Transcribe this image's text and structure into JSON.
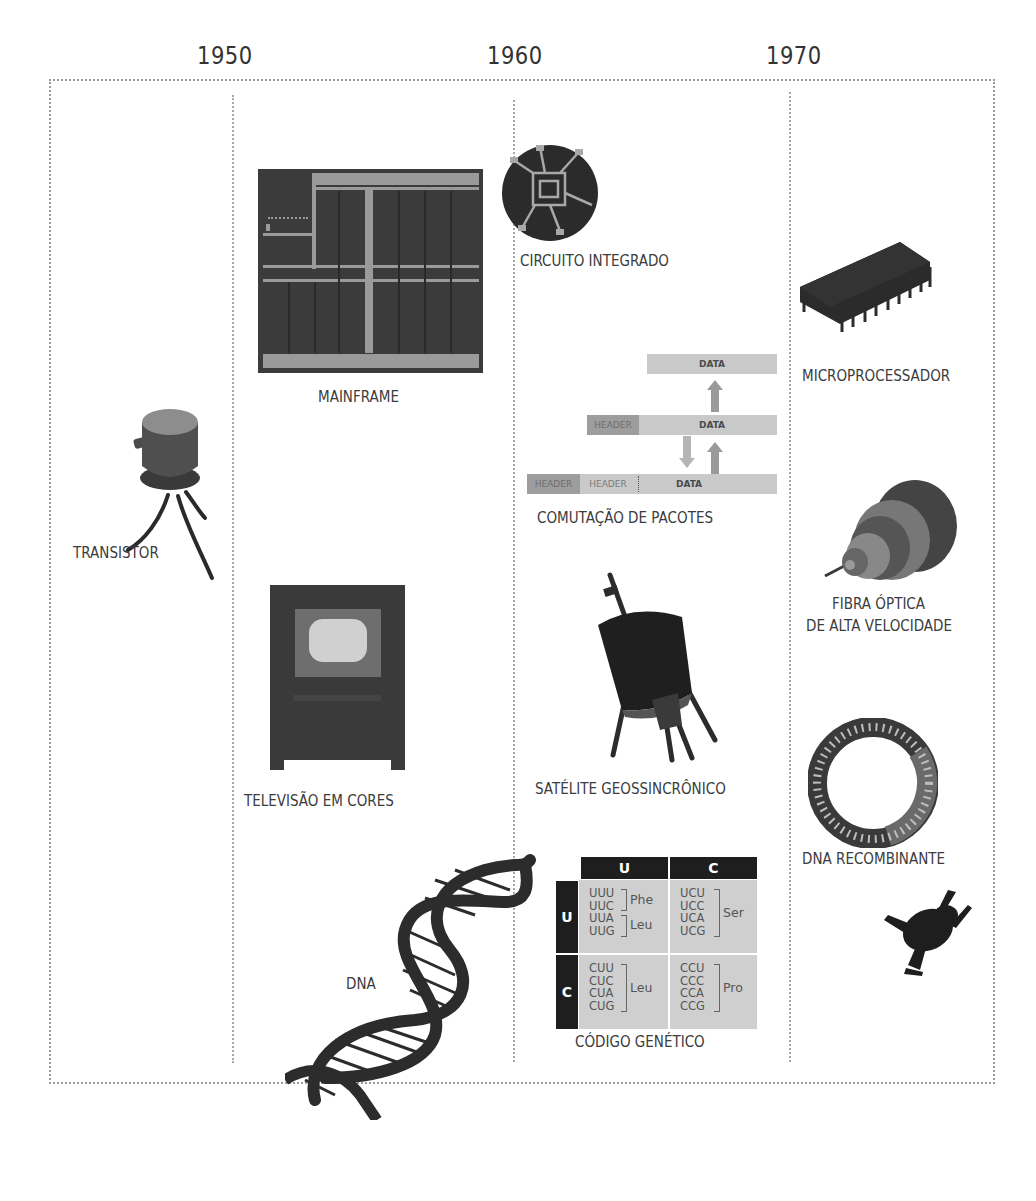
{
  "timeline": {
    "years": [
      "1950",
      "1960",
      "1970"
    ]
  },
  "items": {
    "transistor": {
      "label": "TRANSISTOR",
      "icon": "transistor-icon"
    },
    "mainframe": {
      "label": "MAINFRAME",
      "icon": "mainframe-icon"
    },
    "color_tv": {
      "label": "TELEVISÃO EM CORES",
      "icon": "television-icon"
    },
    "dna": {
      "label": "DNA",
      "icon": "dna-helix-icon"
    },
    "integrated_circuit": {
      "label": "CIRCUITO INTEGRADO",
      "icon": "integrated-circuit-icon"
    },
    "packet_switching": {
      "label": "COMUTAÇÃO DE PACOTES",
      "icon": "packet-switching-diagram",
      "rows": [
        {
          "segments": [
            "DATA"
          ]
        },
        {
          "segments": [
            "HEADER",
            "DATA"
          ]
        },
        {
          "segments": [
            "HEADER",
            "HEADER",
            "DATA"
          ]
        }
      ]
    },
    "geosync_satellite": {
      "label": "SATÉLITE GEOSSINCRÔNICO",
      "icon": "satellite-icon"
    },
    "genetic_code": {
      "label": "CÓDIGO GENÉTICO",
      "col_headers": [
        "U",
        "C"
      ],
      "row_headers": [
        "U",
        "C"
      ],
      "cells": [
        [
          {
            "codons": [
              "UUU",
              "UUC",
              "UUA",
              "UUG"
            ],
            "groups": [
              {
                "aa": "Phe",
                "span": 2
              },
              {
                "aa": "Leu",
                "span": 2
              }
            ]
          },
          {
            "codons": [
              "UCU",
              "UCC",
              "UCA",
              "UCG"
            ],
            "groups": [
              {
                "aa": "Ser",
                "span": 4
              }
            ]
          }
        ],
        [
          {
            "codons": [
              "CUU",
              "CUC",
              "CUA",
              "CUG"
            ],
            "groups": [
              {
                "aa": "Leu",
                "span": 4
              }
            ]
          },
          {
            "codons": [
              "CCU",
              "CCC",
              "CCA",
              "CCG"
            ],
            "groups": [
              {
                "aa": "Pro",
                "span": 4
              }
            ]
          }
        ]
      ]
    },
    "microprocessor": {
      "label": "MICROPROCESSADOR",
      "icon": "microchip-icon"
    },
    "fiber_optic": {
      "label_line1": "FIBRA ÓPTICA",
      "label_line2": "DE ALTA VELOCIDADE",
      "icon": "fiber-optic-cable-icon"
    },
    "recombinant_dna": {
      "label": "DNA RECOMBINANTE",
      "icon": "plasmid-ring-icon"
    },
    "frog": {
      "icon": "frog-icon"
    }
  },
  "colors": {
    "dark": "#222222",
    "mid_gray": "#8c8c8c",
    "light_gray": "#c9c9c9",
    "frame_dots": "#9a9a9a"
  }
}
